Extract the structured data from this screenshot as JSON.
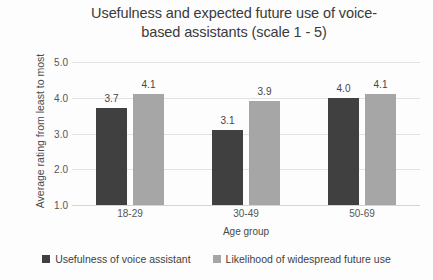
{
  "chart_data": {
    "type": "bar",
    "title_line1": "Usefulness and expected future use of voice-",
    "title_line2": "based assistants (scale 1 - 5)",
    "xlabel": "Age group",
    "ylabel": "Average rating from least to most",
    "categories": [
      "18-29",
      "30-49",
      "50-69"
    ],
    "ylim": [
      1.0,
      5.0
    ],
    "ytick_labels": [
      "5.0",
      "4.0",
      "3.0",
      "2.0",
      "1.0"
    ],
    "ytick_values": [
      5.0,
      4.0,
      3.0,
      2.0,
      1.0
    ],
    "grid": true,
    "legend_position": "bottom",
    "series": [
      {
        "name": "Usefulness of voice assistant",
        "color": "#404040",
        "values": [
          3.7,
          3.1,
          4.0
        ],
        "labels": [
          "3.7",
          "3.1",
          "4.0"
        ]
      },
      {
        "name": "Likelihood of widespread future use",
        "color": "#a6a6a6",
        "values": [
          4.1,
          3.9,
          4.1
        ],
        "labels": [
          "4.1",
          "3.9",
          "4.1"
        ]
      }
    ]
  }
}
